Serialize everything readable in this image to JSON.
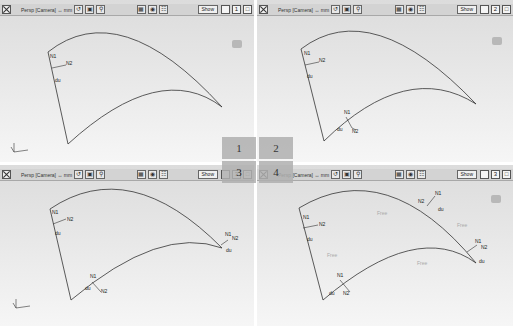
{
  "viewports": [
    {
      "id": "1",
      "toolbar": {
        "title": "Persp [Camera] ↔ mm",
        "show_label": "Show",
        "page_num": "1"
      },
      "labels": {
        "N1": "N1",
        "N2": "N2",
        "du": "du"
      }
    },
    {
      "id": "2",
      "toolbar": {
        "title": "Persp [Camera] ↔ mm",
        "show_label": "Show",
        "page_num": "2"
      },
      "labels": {
        "N1": "N1",
        "N2": "N2",
        "du": "du",
        "N1b": "N1",
        "N2b": "N2",
        "dub": "du"
      }
    },
    {
      "id": "3",
      "toolbar": {
        "title": "Persp [Camera] ↔ mm",
        "show_label": "Show",
        "page_num": "3"
      },
      "labels": {
        "N1": "N1",
        "N2": "N2",
        "du": "du",
        "N1b": "N1",
        "N2b": "N2",
        "dub": "du",
        "N1c": "N1",
        "N2c": "N2",
        "duc": "du"
      }
    },
    {
      "id": "4",
      "toolbar": {
        "title": "Persp [Camera] ↔ mm",
        "show_label": "Show",
        "page_num": "3"
      },
      "labels": {
        "N1": "N1",
        "N2": "N2",
        "du": "du",
        "N1b": "N1",
        "N2b": "N2",
        "dub": "du",
        "N1c": "N1",
        "N2c": "N2",
        "duc": "du",
        "N1d": "N1",
        "N2d": "N2",
        "dud": "du",
        "free": "Free"
      }
    }
  ],
  "selector": {
    "q1": "1",
    "q2": "2",
    "q3": "3",
    "q4": "4"
  },
  "colors": {
    "curve": "#333333",
    "viewport_bg": "#e4e4e4",
    "toolbar_bg": "#d3d3d3"
  }
}
